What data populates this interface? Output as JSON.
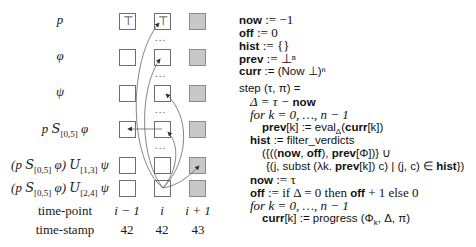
{
  "rows": [
    {
      "label": "p",
      "cells": [
        "⊤",
        "⊤",
        ""
      ]
    },
    {
      "label": "φ",
      "cells": [
        "",
        "",
        ""
      ]
    },
    {
      "label": "ψ",
      "cells": [
        "",
        "",
        ""
      ]
    },
    {
      "label_parts": {
        "a": "p ",
        "op": "S",
        "sub": "[0,5]",
        "b": " φ"
      },
      "cells": [
        "",
        "",
        ""
      ]
    },
    {
      "label_parts": {
        "a": "(p ",
        "op": "S",
        "sub": "[0,5]",
        "b": " φ) ",
        "op2": "U",
        "sub2": "[1,3]",
        "c": " ψ"
      },
      "cells": [
        "",
        "",
        ""
      ]
    },
    {
      "label_parts": {
        "a": "(p ",
        "op": "S",
        "sub": "[0,5]",
        "b": " φ) ",
        "op2": "U",
        "sub2": "[2,4]",
        "c": " ψ"
      },
      "cells": [
        "",
        "",
        ""
      ]
    }
  ],
  "ellipsis": "...",
  "footer": {
    "time_point_label": "time-point",
    "time_stamp_label": "time-stamp",
    "time_points": [
      "i − 1",
      "i",
      "i + 1"
    ],
    "time_stamps": [
      "42",
      "42",
      "43"
    ]
  },
  "colors": {
    "future_cell": "#c8c8c8",
    "cell_border": "#6e6e6e",
    "arrow": "#555555"
  },
  "code": {
    "init": [
      {
        "kw": "now",
        "rest": " := −1"
      },
      {
        "kw": "off",
        "rest": " := 0"
      },
      {
        "kw": "hist",
        "rest": " := {}"
      },
      {
        "kw": "prev",
        "rest": " := ⊥ⁿ"
      },
      {
        "kw": "curr",
        "rest": " := (Now ⊥)ⁿ"
      }
    ],
    "step_header": "step (τ, π) =",
    "delta_line": {
      "pre": "Δ = τ − ",
      "kw": "now"
    },
    "for1": "for k = 0, …, n − 1",
    "prev_assign": {
      "kw": "prev",
      "mid": "[k] := eval",
      "sub": "Δ",
      "open": "(",
      "kw2": "curr",
      "end": "[k])"
    },
    "hist_assign": {
      "kw": "hist",
      "rest": " := filter_verdicts"
    },
    "hist_line2": {
      "p1": "({((",
      "kw1": "now",
      "p2": ", ",
      "kw2": "off",
      "p3": "), ",
      "kw3": "prev",
      "p4": "[Φ])} ∪"
    },
    "hist_line3": {
      "p1": "{(j, subst (λk. ",
      "kw1": "prev",
      "p2": "[k]) c) | (j, c) ∈ ",
      "kw2": "hist",
      "p3": "})"
    },
    "now_assign": {
      "kw": "now",
      "rest": " := τ"
    },
    "off_assign": {
      "kw": "off",
      "p1": " := if Δ = 0 then ",
      "kw2": "off",
      "p2": " + 1 else 0"
    },
    "for2": "for k = 0, …, n − 1",
    "curr_assign": {
      "kw": "curr",
      "rest": "[k] := progress (Φ",
      "sub": "k",
      "end": ", Δ, π)"
    }
  }
}
